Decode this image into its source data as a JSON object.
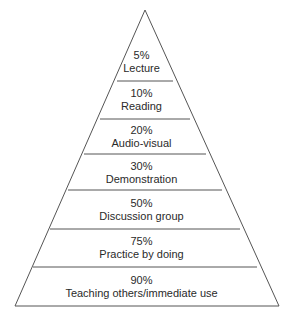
{
  "diagram": {
    "type": "pyramid",
    "stroke_color": "#555555",
    "text_color": "#2a2a2a",
    "levels": [
      {
        "percent": "5%",
        "label": "Lecture"
      },
      {
        "percent": "10%",
        "label": "Reading"
      },
      {
        "percent": "20%",
        "label": "Audio-visual"
      },
      {
        "percent": "30%",
        "label": "Demonstration"
      },
      {
        "percent": "50%",
        "label": "Discussion group"
      },
      {
        "percent": "75%",
        "label": "Practice by doing"
      },
      {
        "percent": "90%",
        "label": "Teaching others/immediate use"
      }
    ]
  }
}
